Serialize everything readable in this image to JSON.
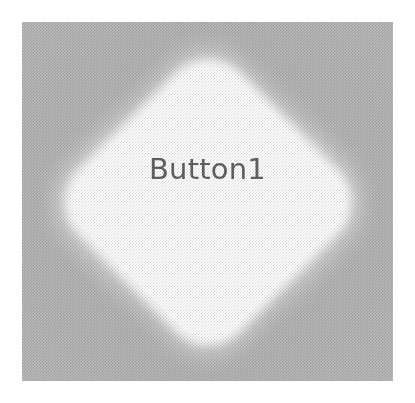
{
  "image": {
    "width": 415,
    "height": 403,
    "background_color": "#ffffff",
    "description": "Screenshot of a single diamond-shaped push button widget rendered on a flat gray panel"
  },
  "panel": {
    "name": "widget-preview-panel",
    "background_color": "#b4b4b4",
    "left": 22,
    "top": 22,
    "width": 371,
    "height": 359,
    "texture": "halftone-dither"
  },
  "widget": {
    "type": "button",
    "shape": "diamond",
    "label": "Button1",
    "label_color": "#5c5c5c",
    "fill_color": "#ffffff",
    "shadow_color": "#5c5c5c",
    "center_x": 208,
    "center_y": 201,
    "width": 348,
    "height": 348,
    "state": "normal",
    "enabled": true
  }
}
